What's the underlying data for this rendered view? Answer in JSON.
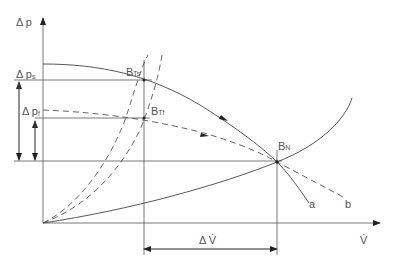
{
  "diagram": {
    "axes": {
      "y_label": "Δ p",
      "x_label": "V̇"
    },
    "levels": {
      "ps_label": "Δ p",
      "ps_sub": "s",
      "pf_label": "Δ p",
      "pf_sub": "f"
    },
    "points": {
      "BTs": {
        "main": "B",
        "sub": "Ts"
      },
      "BTf": {
        "main": "B",
        "sub": "Tf"
      },
      "BN": {
        "main": "B",
        "sub": "N"
      }
    },
    "curves": {
      "a": "a",
      "b": "b"
    },
    "delta_flow_label": "Δ V̇"
  }
}
